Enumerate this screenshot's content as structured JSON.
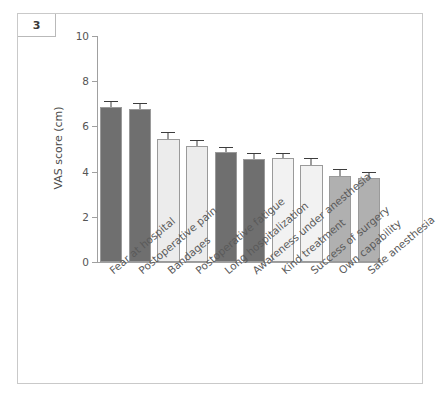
{
  "figure": {
    "panel_number": "3",
    "background": "#ffffff",
    "frame_color": "#c9c9c9"
  },
  "chart_data": {
    "type": "bar",
    "title": "",
    "subtitle": "",
    "xlabel": "",
    "ylabel": "VAS score (cm)",
    "ylim": [
      0,
      10
    ],
    "yticks": [
      0,
      2,
      4,
      6,
      8,
      10
    ],
    "ytick_labels": [
      "0",
      "2",
      "4",
      "6",
      "8",
      "10"
    ],
    "grid": false,
    "legend": false,
    "legend_position": "none",
    "orientation": "vertical",
    "error_bars": "upper only (SEM)",
    "categories": [
      "Fear at hospital",
      "Postoperative pain",
      "Bandages",
      "Postoperative fatigue",
      "Long hospitalization",
      "Awareness under anesthesia",
      "Kind treatment",
      "Success of surgery",
      "Own capability",
      "Safe anesthesia"
    ],
    "values": [
      6.85,
      6.75,
      5.45,
      5.15,
      4.85,
      4.55,
      4.6,
      4.3,
      3.8,
      3.7
    ],
    "errors": [
      0.25,
      0.25,
      0.25,
      0.2,
      0.2,
      0.25,
      0.2,
      0.25,
      0.25,
      0.25
    ],
    "bar_colors": [
      "#6f6f6f",
      "#6f6f6f",
      "#ececec",
      "#ececec",
      "#6f6f6f",
      "#6f6f6f",
      "#f2f2f2",
      "#f2f2f2",
      "#b0b0b0",
      "#b0b0b0"
    ],
    "bar_edge_color": "#9a9a9a",
    "error_bar_color": "#3d3d3d",
    "axis_color": "#a0a0a0",
    "tick_label_color": "#555555",
    "category_label_rotation_deg": -40
  }
}
